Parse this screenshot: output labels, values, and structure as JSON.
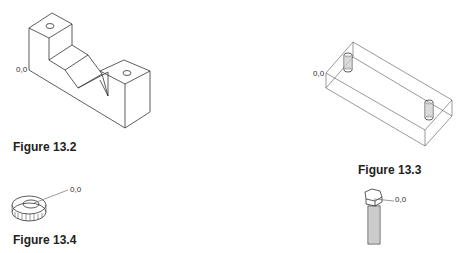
{
  "figures": [
    {
      "id": "fig-13-2",
      "caption": "Figure 13.2",
      "origin_label": "0,0",
      "subject": "isometric V-block with two drilled holes"
    },
    {
      "id": "fig-13-3",
      "caption": "Figure 13.3",
      "origin_label": "0,0",
      "subject": "rectangular block with two cylindrical holes"
    },
    {
      "id": "fig-13-4",
      "caption": "Figure 13.4",
      "origin_label": "0,0",
      "subject": "washer"
    },
    {
      "id": "fig-13-5",
      "caption": "",
      "origin_label": "0,0",
      "subject": "hex-head bolt"
    }
  ]
}
